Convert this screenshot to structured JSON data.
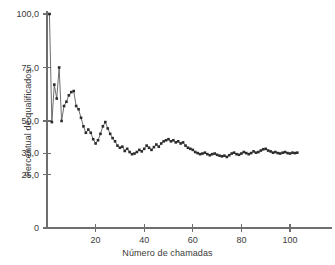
{
  "chart_data": {
    "type": "line",
    "title": "",
    "subtitle": "",
    "xlabel": "Número de chamadas",
    "ylabel": "Percentual de qualificados",
    "xlim": [
      0,
      115
    ],
    "ylim": [
      0,
      104
    ],
    "grid": false,
    "legend": null,
    "markers": "filled-square",
    "line_color": "#5c5c5c",
    "marker_color": "#2b2b2b",
    "x_ticks": [
      20,
      40,
      60,
      80,
      100
    ],
    "x_tick_labels": [
      "20",
      "40",
      "60",
      "80",
      "100"
    ],
    "y_ticks": [
      0,
      25,
      35,
      50,
      75,
      100
    ],
    "y_tick_labels": [
      "0",
      "25,0",
      "35,0",
      "50,0",
      "75,0",
      "100,0"
    ],
    "decimal_separator": ",",
    "series": [
      {
        "name": "Percentual de qualificados",
        "x": [
          1,
          2,
          3,
          4,
          5,
          6,
          7,
          8,
          9,
          10,
          11,
          12,
          13,
          14,
          15,
          16,
          17,
          18,
          19,
          20,
          21,
          22,
          23,
          24,
          25,
          26,
          27,
          28,
          29,
          30,
          31,
          32,
          33,
          34,
          35,
          36,
          37,
          38,
          39,
          40,
          41,
          42,
          43,
          44,
          45,
          46,
          47,
          48,
          49,
          50,
          51,
          52,
          53,
          54,
          55,
          56,
          57,
          58,
          59,
          60,
          61,
          62,
          63,
          64,
          65,
          66,
          67,
          68,
          69,
          70,
          71,
          72,
          73,
          74,
          75,
          76,
          77,
          78,
          79,
          80,
          81,
          82,
          83,
          84,
          85,
          86,
          87,
          88,
          89,
          90,
          91,
          92,
          93,
          94,
          95,
          96,
          97,
          98,
          99,
          100,
          101,
          102,
          103
        ],
        "values": [
          100.0,
          49.5,
          67.0,
          60.5,
          75.0,
          50.0,
          57.0,
          59.0,
          62.0,
          63.5,
          64.0,
          57.0,
          55.5,
          51.5,
          47.5,
          44.5,
          46.0,
          44.5,
          41.5,
          39.5,
          41.0,
          44.0,
          47.5,
          49.5,
          46.5,
          44.0,
          42.0,
          40.5,
          38.5,
          37.5,
          38.0,
          36.0,
          37.0,
          35.5,
          34.5,
          34.8,
          35.5,
          36.5,
          35.8,
          37.0,
          38.5,
          37.5,
          36.5,
          37.8,
          39.0,
          38.0,
          39.5,
          40.5,
          41.0,
          41.5,
          40.5,
          41.0,
          40.0,
          40.5,
          39.5,
          40.0,
          38.5,
          37.5,
          37.0,
          36.5,
          35.5,
          35.0,
          34.5,
          34.8,
          35.2,
          34.5,
          34.0,
          34.5,
          34.8,
          34.2,
          33.8,
          33.5,
          33.8,
          33.2,
          34.0,
          34.8,
          35.2,
          34.5,
          34.2,
          34.8,
          35.5,
          35.0,
          34.5,
          35.0,
          35.8,
          35.2,
          35.5,
          36.2,
          36.8,
          37.0,
          36.2,
          35.8,
          35.2,
          35.5,
          35.0,
          34.8,
          35.2,
          35.5,
          35.0,
          34.8,
          35.2,
          35.0,
          35.2
        ]
      }
    ]
  }
}
